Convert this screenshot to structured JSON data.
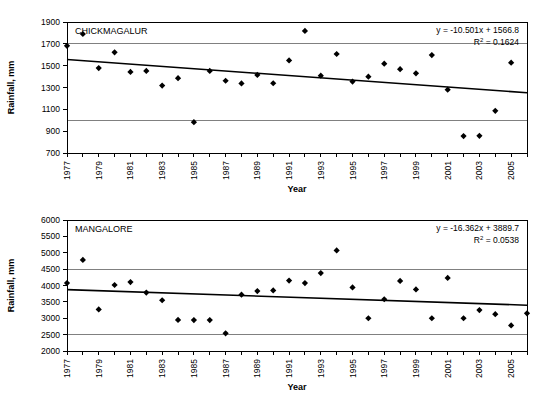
{
  "figure": {
    "background": "#ffffff",
    "marker_color": "#000000",
    "gridline_color": "#808080",
    "axis_color": "#000000"
  },
  "chart_data": [
    {
      "type": "scatter",
      "id": "chickmagalur",
      "title": "CHICKMAGALUR",
      "xlabel": "Year",
      "ylabel": "Rainfall, mm",
      "ylim": [
        700,
        1900
      ],
      "ytick_step": 200,
      "yticks": [
        700,
        900,
        1100,
        1300,
        1500,
        1700,
        1900
      ],
      "ytick_labels": [
        "700",
        "900",
        "1100",
        "1300",
        "1500",
        "1700",
        "1900"
      ],
      "xlim": [
        1977,
        2006
      ],
      "xticks": [
        1977,
        1978,
        1979,
        1980,
        1981,
        1982,
        1983,
        1984,
        1985,
        1986,
        1987,
        1988,
        1989,
        1990,
        1991,
        1992,
        1993,
        1994,
        1995,
        1996,
        1997,
        1998,
        1999,
        2000,
        2001,
        2002,
        2003,
        2004,
        2005,
        2006
      ],
      "xtick_labels": [
        "1977",
        "",
        "1979",
        "",
        "1981",
        "",
        "1983",
        "",
        "1985",
        "",
        "1987",
        "",
        "1989",
        "",
        "1991",
        "",
        "1993",
        "",
        "1995",
        "",
        "1997",
        "",
        "1999",
        "",
        "2001",
        "",
        "2003",
        "",
        "2005",
        ""
      ],
      "gridlines_y": [
        1000,
        1700
      ],
      "grid": "partial-horizontal",
      "legend": "none",
      "x": [
        1977,
        1978,
        1979,
        1980,
        1981,
        1982,
        1983,
        1984,
        1985,
        1986,
        1987,
        1988,
        1989,
        1990,
        1991,
        1992,
        1993,
        1994,
        1995,
        1996,
        1997,
        1998,
        1999,
        2000,
        2001,
        2002,
        2003,
        2004,
        2005
      ],
      "values": [
        1682,
        1790,
        1478,
        1622,
        1443,
        1452,
        1318,
        1385,
        982,
        1452,
        1362,
        1337,
        1415,
        1339,
        1548,
        1818,
        1408,
        1607,
        1354,
        1399,
        1518,
        1468,
        1430,
        1597,
        1280,
        855,
        857,
        1086,
        1527
      ],
      "trend": {
        "equation": "y = -10.501x + 1566.8",
        "r2_label": "R",
        "r2_sup": "2",
        "r2_value": " = 0.1624",
        "slope": -10.501,
        "intercept": 1566.8,
        "x_start": 1977,
        "x_end": 2006,
        "y_start": 1556.3,
        "y_end": 1251.8
      }
    },
    {
      "type": "scatter",
      "id": "mangalore",
      "title": "MANGALORE",
      "xlabel": "Year",
      "ylabel": "Rainfall, mm",
      "ylim": [
        2000,
        6000
      ],
      "ytick_step": 500,
      "yticks": [
        2000,
        2500,
        3000,
        3500,
        4000,
        4500,
        5000,
        5500,
        6000
      ],
      "ytick_labels": [
        "2000",
        "2500",
        "3000",
        "3500",
        "4000",
        "4500",
        "5000",
        "5500",
        "6000"
      ],
      "xlim": [
        1977,
        2006
      ],
      "xticks": [
        1977,
        1978,
        1979,
        1980,
        1981,
        1982,
        1983,
        1984,
        1985,
        1986,
        1987,
        1988,
        1989,
        1990,
        1991,
        1992,
        1993,
        1994,
        1995,
        1996,
        1997,
        1998,
        1999,
        2000,
        2001,
        2002,
        2003,
        2004,
        2005,
        2006
      ],
      "xtick_labels": [
        "1977",
        "",
        "1979",
        "",
        "1981",
        "",
        "1983",
        "",
        "1985",
        "",
        "1987",
        "",
        "1989",
        "",
        "1991",
        "",
        "1993",
        "",
        "1995",
        "",
        "1997",
        "",
        "1999",
        "",
        "2001",
        "",
        "2003",
        "",
        "2005",
        ""
      ],
      "gridlines_y": [
        2500,
        4500
      ],
      "grid": "partial-horizontal",
      "legend": "none",
      "x": [
        1977,
        1978,
        1979,
        1980,
        1981,
        1982,
        1983,
        1984,
        1985,
        1986,
        1987,
        1988,
        1989,
        1990,
        1991,
        1992,
        1993,
        1994,
        1995,
        1996,
        1997,
        1998,
        1999,
        2000,
        2001,
        2002,
        2003,
        2004,
        2005,
        2006
      ],
      "values": [
        4075,
        4780,
        3270,
        4015,
        4105,
        3785,
        3550,
        2950,
        2945,
        2945,
        2540,
        3720,
        3830,
        3850,
        4150,
        4075,
        4380,
        5070,
        3940,
        3000,
        3580,
        4140,
        3880,
        3000,
        4230,
        3000,
        3250,
        3125,
        2780,
        3150
      ],
      "trend": {
        "equation": "y = -16.362x + 3889.7",
        "r2_label": "R",
        "r2_sup": "2",
        "r2_value": " = 0.0538",
        "slope": -16.362,
        "intercept": 3889.7,
        "x_start": 1977,
        "x_end": 2006,
        "y_start": 3873.3,
        "y_end": 3398.8
      }
    }
  ]
}
